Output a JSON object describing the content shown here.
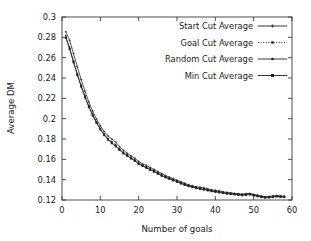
{
  "chart_data": {
    "type": "line",
    "title": "",
    "xlabel": "Number of goals",
    "ylabel": "Average DM",
    "xlim": [
      0,
      60
    ],
    "ylim": [
      0.12,
      0.3
    ],
    "xticks": [
      "0",
      "10",
      "20",
      "30",
      "40",
      "50",
      "60"
    ],
    "xtick_values": [
      0,
      10,
      20,
      30,
      40,
      50,
      60
    ],
    "yticks": [
      "0.12",
      "0.14",
      "0.16",
      "0.18",
      "0.2",
      "0.22",
      "0.24",
      "0.26",
      "0.28",
      "0.3"
    ],
    "ytick_values": [
      0.12,
      0.14,
      0.16,
      0.18,
      0.2,
      0.22,
      0.24,
      0.26,
      0.28,
      0.3
    ],
    "grid": false,
    "legend_position": "upper-right",
    "x": [
      1,
      2,
      3,
      4,
      5,
      6,
      7,
      8,
      9,
      10,
      11,
      12,
      13,
      14,
      15,
      16,
      17,
      18,
      19,
      20,
      21,
      22,
      23,
      24,
      25,
      26,
      27,
      28,
      29,
      30,
      31,
      32,
      33,
      34,
      35,
      36,
      37,
      38,
      39,
      40,
      41,
      42,
      43,
      44,
      45,
      46,
      47,
      48,
      49,
      50,
      51,
      52,
      53,
      54,
      55,
      56,
      57,
      58
    ],
    "series": [
      {
        "name": "Start Cut Average",
        "marker": "plus",
        "dash": "none",
        "values": [
          0.2855,
          0.277,
          0.264,
          0.251,
          0.2385,
          0.227,
          0.2165,
          0.2075,
          0.1995,
          0.193,
          0.1875,
          0.183,
          0.18,
          0.177,
          0.1725,
          0.169,
          0.166,
          0.1635,
          0.161,
          0.158,
          0.1555,
          0.154,
          0.152,
          0.15,
          0.148,
          0.146,
          0.144,
          0.1425,
          0.141,
          0.1395,
          0.138,
          0.1365,
          0.135,
          0.134,
          0.133,
          0.1325,
          0.132,
          0.131,
          0.13,
          0.1295,
          0.129,
          0.128,
          0.1275,
          0.127,
          0.1265,
          0.1262,
          0.1258,
          0.1262,
          0.1265,
          0.1255,
          0.1248,
          0.124,
          0.1232,
          0.1235,
          0.124,
          0.1245,
          0.124,
          0.1238
        ]
      },
      {
        "name": "Goal Cut Average",
        "marker": "square-small",
        "dash": "dotted",
        "values": [
          0.2815,
          0.27,
          0.257,
          0.2445,
          0.233,
          0.2225,
          0.213,
          0.2045,
          0.197,
          0.1905,
          0.185,
          0.1805,
          0.1775,
          0.1745,
          0.1705,
          0.167,
          0.1645,
          0.162,
          0.1595,
          0.1565,
          0.1545,
          0.1528,
          0.1508,
          0.149,
          0.147,
          0.145,
          0.1432,
          0.1418,
          0.1402,
          0.1388,
          0.1372,
          0.1358,
          0.1345,
          0.1335,
          0.1325,
          0.1318,
          0.1312,
          0.1302,
          0.1295,
          0.1288,
          0.1282,
          0.1275,
          0.127,
          0.1265,
          0.126,
          0.1257,
          0.1253,
          0.1257,
          0.126,
          0.125,
          0.1243,
          0.1235,
          0.1228,
          0.123,
          0.1235,
          0.124,
          0.1236,
          0.1234
        ]
      },
      {
        "name": "Random Cut Average",
        "marker": "dot",
        "dash": "none",
        "values": [
          0.28,
          0.269,
          0.256,
          0.2435,
          0.232,
          0.2215,
          0.212,
          0.2035,
          0.1962,
          0.1898,
          0.1842,
          0.1798,
          0.1762,
          0.1732,
          0.1695,
          0.1662,
          0.1638,
          0.1612,
          0.1588,
          0.1558,
          0.1538,
          0.152,
          0.15,
          0.1482,
          0.1462,
          0.1442,
          0.1425,
          0.1412,
          0.1396,
          0.1382,
          0.1366,
          0.1352,
          0.134,
          0.133,
          0.132,
          0.1312,
          0.1306,
          0.1298,
          0.129,
          0.1284,
          0.1278,
          0.1272,
          0.1266,
          0.1262,
          0.1258,
          0.1254,
          0.125,
          0.1254,
          0.1258,
          0.1248,
          0.124,
          0.1232,
          0.1226,
          0.1228,
          0.1232,
          0.1238,
          0.1234,
          0.1232
        ]
      },
      {
        "name": "Min Cut Average",
        "marker": "square",
        "dash": "none",
        "values": [
          0.2795,
          0.2685,
          0.2555,
          0.243,
          0.2315,
          0.221,
          0.2115,
          0.203,
          0.1958,
          0.1894,
          0.1838,
          0.1794,
          0.1758,
          0.1728,
          0.1692,
          0.1658,
          0.1634,
          0.1608,
          0.1584,
          0.1554,
          0.1534,
          0.1516,
          0.1496,
          0.1478,
          0.1458,
          0.1438,
          0.1422,
          0.1408,
          0.1392,
          0.1378,
          0.1362,
          0.1348,
          0.1336,
          0.1326,
          0.1316,
          0.1308,
          0.1302,
          0.1294,
          0.1286,
          0.128,
          0.1274,
          0.1268,
          0.1262,
          0.1258,
          0.1254,
          0.125,
          0.1246,
          0.125,
          0.1254,
          0.1244,
          0.1236,
          0.1228,
          0.1222,
          0.1224,
          0.1228,
          0.1234,
          0.123,
          0.1228
        ]
      }
    ]
  },
  "colors": {
    "line": "#202020",
    "axis": "#3a3a3a",
    "text": "#1a1a1a",
    "background": "#ffffff"
  }
}
